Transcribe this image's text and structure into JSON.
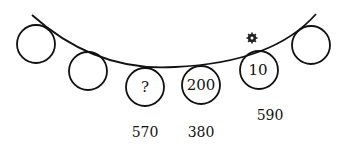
{
  "puzzle": {
    "circles": [
      {
        "value": ""
      },
      {
        "value": ""
      },
      {
        "value": "?"
      },
      {
        "value": "200"
      },
      {
        "value": "10"
      },
      {
        "value": ""
      }
    ],
    "labels": [
      {
        "value": "570",
        "under_circle": 3
      },
      {
        "value": "380",
        "under_circle": 4
      },
      {
        "value": "590",
        "under_circle": 5
      }
    ],
    "marker": "gear-star-icon"
  }
}
